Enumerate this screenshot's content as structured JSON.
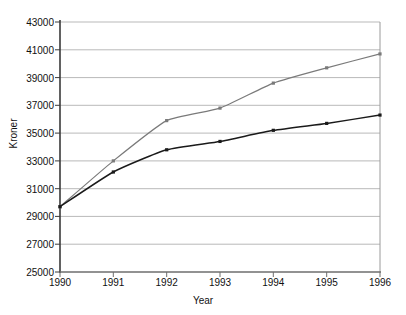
{
  "chart_data": {
    "type": "line",
    "title": "",
    "xlabel": "Year",
    "ylabel": "Kroner",
    "categories": [
      "1990",
      "1991",
      "1992",
      "1993",
      "1994",
      "1995",
      "1996"
    ],
    "x": [
      1990,
      1991,
      1992,
      1993,
      1994,
      1995,
      1996
    ],
    "xlim": [
      1990,
      1996
    ],
    "ylim": [
      25000,
      43000
    ],
    "yticks": [
      25000,
      27000,
      29000,
      31000,
      33000,
      35000,
      37000,
      39000,
      41000,
      43000
    ],
    "ytick_labels": [
      "25000",
      "27000",
      "29000",
      "31000",
      "33000",
      "35000",
      "37000",
      "39000",
      "41000",
      "43000"
    ],
    "xtick_labels": [
      "1990",
      "1991",
      "1992",
      "1993",
      "1994",
      "1995",
      "1996"
    ],
    "grid": "horizontal",
    "legend": "none",
    "series": [
      {
        "name": "upper-series",
        "color": "#7a7a7a",
        "marker": "square",
        "values": [
          29700,
          33000,
          35900,
          36800,
          38600,
          39700,
          40700
        ]
      },
      {
        "name": "lower-series",
        "color": "#1a1a1a",
        "marker": "square",
        "values": [
          29700,
          32200,
          33800,
          34400,
          35200,
          35700,
          36300
        ]
      }
    ]
  },
  "axes": {
    "y_axis_title": "Kroner",
    "x_axis_title": "Year"
  },
  "colors": {
    "gridline": "#b9b9b9",
    "axis": "#555555",
    "series_upper": "#7a7a7a",
    "series_lower": "#1a1a1a",
    "background": "#ffffff"
  }
}
